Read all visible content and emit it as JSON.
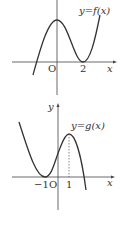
{
  "top_graph": {
    "function_label": "y=f(x)",
    "origin_label": "O",
    "x_tick_label": "2",
    "x_axis_label": "x",
    "stroke_color": "#333333"
  },
  "bottom_graph": {
    "function_label": "y=g(x)",
    "origin_label": "O",
    "x_tick_neg_label": "−1",
    "x_tick_pos_label": "1",
    "x_axis_label": "x",
    "y_axis_label": "y",
    "stroke_color": "#333333"
  }
}
